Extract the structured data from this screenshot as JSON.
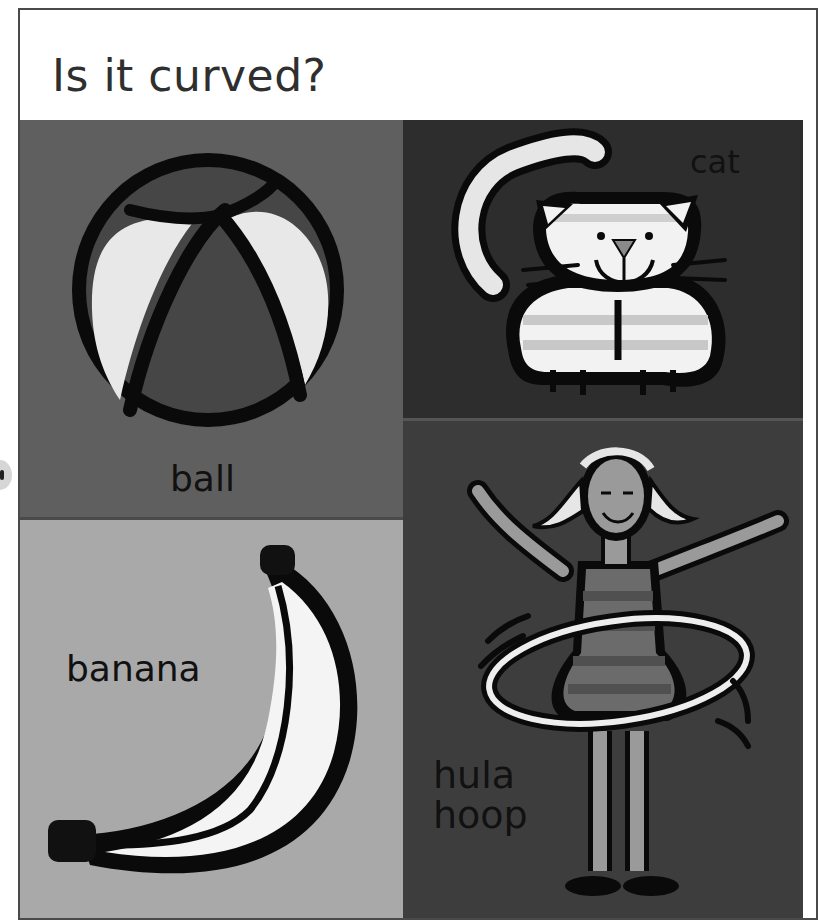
{
  "page": {
    "title": "Is it curved?",
    "panels": [
      {
        "id": "ball",
        "label": "ball",
        "background": "#5f5f5f"
      },
      {
        "id": "cat",
        "label": "cat",
        "background": "#2d2d2d"
      },
      {
        "id": "banana",
        "label": "banana",
        "background": "#a9a9a9"
      },
      {
        "id": "hula",
        "label_line1": "hula",
        "label_line2": "hoop",
        "background": "#3d3d3d"
      }
    ]
  },
  "colors": {
    "frame": "#4a4a4a",
    "title_text": "#2f2f2f",
    "outline": "#0a0a0a",
    "light_fill": "#e6e6e6",
    "white_fill": "#f4f4f4"
  }
}
